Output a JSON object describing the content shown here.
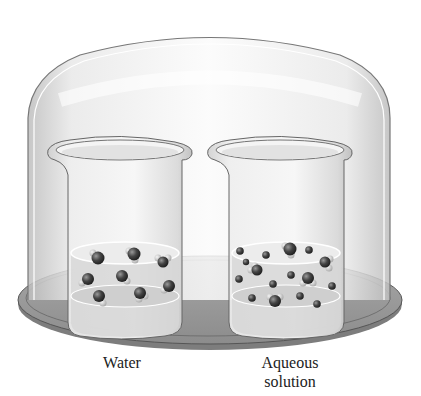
{
  "figure": {
    "labels": {
      "water": "Water",
      "aqueous": "Aqueous solution",
      "aqueous_line1": "Aqueous",
      "aqueous_line2": "solution"
    },
    "components": [
      "bell-jar",
      "base-plate",
      "beaker-water",
      "beaker-aqueous-solution",
      "water-molecules",
      "solute-particles"
    ],
    "colors": {
      "glass": "#e6e6e6",
      "plate": "#9a9a9a",
      "molecule": "#3a3a3a",
      "hydrogen": "#d0d0d0"
    },
    "counts": {
      "water_beaker_molecules": 8,
      "aqueous_beaker_water_molecules": 6,
      "aqueous_beaker_solute_particles": 13
    }
  }
}
